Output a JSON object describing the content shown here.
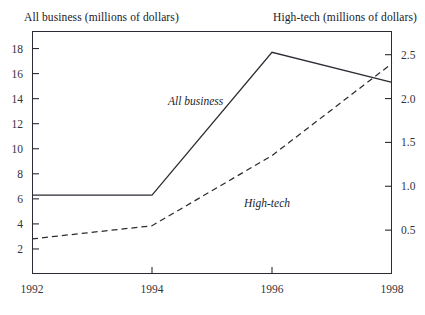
{
  "chart_data": {
    "type": "line",
    "title": "",
    "x": [
      1992,
      1994,
      1996,
      1998
    ],
    "xlabel": "",
    "xticks": [
      "1992",
      "1994",
      "1996",
      "1998"
    ],
    "xlim": [
      1992,
      1998
    ],
    "grid": false,
    "legend_position": "inline-annotations",
    "left_axis": {
      "label": "All business (millions of dollars)",
      "ylim": [
        0,
        19.4
      ],
      "ticks": [
        2,
        4,
        6,
        8,
        10,
        12,
        14,
        16,
        18
      ],
      "ticklabels": [
        "2",
        "4",
        "6",
        "8",
        "10",
        "12",
        "14",
        "16",
        "18"
      ]
    },
    "right_axis": {
      "label": "High-tech (millions of dollars)",
      "ylim": [
        0,
        2.77
      ],
      "ticks": [
        0.5,
        1.0,
        1.5,
        2.0,
        2.5
      ],
      "ticklabels": [
        "0.5",
        "1.0",
        "1.5",
        "2.0",
        "2.5"
      ]
    },
    "series": [
      {
        "name": "All business",
        "axis": "left",
        "style": "solid",
        "color": "#2b2b33",
        "annotation": "All business",
        "values": [
          6.3,
          6.3,
          17.7,
          15.3
        ]
      },
      {
        "name": "High-tech",
        "axis": "right",
        "style": "dashed",
        "color": "#2b2b33",
        "annotation": "High-tech",
        "values": [
          0.4,
          0.55,
          1.35,
          2.4
        ]
      }
    ]
  },
  "axis_titles": {
    "left": "All business (millions of dollars)",
    "right": "High-tech (millions of dollars)"
  },
  "annotations": {
    "all_business": "All business",
    "high_tech": "High-tech"
  },
  "left_ticks": [
    "18",
    "16",
    "14",
    "12",
    "10",
    "8",
    "6",
    "4",
    "2"
  ],
  "right_ticks": [
    "2.5",
    "2.0",
    "1.5",
    "1.0",
    "0.5"
  ],
  "x_ticks": [
    "1992",
    "1994",
    "1996",
    "1998"
  ]
}
